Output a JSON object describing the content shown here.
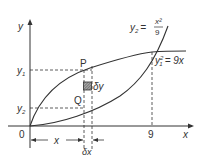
{
  "diagram": {
    "axes": {
      "x_label": "x",
      "y_label": "y",
      "origin_label": "0",
      "x_tick": "9"
    },
    "curves": [
      {
        "name": "upper",
        "equation_lhs": "y",
        "equation_sub": "1",
        "equation_sup": "2",
        "equation_rhs": "= 9x"
      },
      {
        "name": "lower",
        "equation_lhs": "y",
        "equation_sub": "2",
        "equation_eq": "=",
        "numerator": "x²",
        "denominator": "9"
      }
    ],
    "points": {
      "P": "P",
      "Q": "Q"
    },
    "levels": {
      "y1_main": "y",
      "y1_sub": "1",
      "y2_main": "y",
      "y2_sub": "2"
    },
    "element": {
      "dy": "δy",
      "dx": "δx",
      "x_span": "x"
    },
    "colors": {
      "line": "#333333",
      "strip_fill": "#777777"
    }
  }
}
